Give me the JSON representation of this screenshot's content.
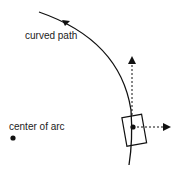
{
  "diagram": {
    "labels": {
      "curved_path": "curved path",
      "center_of_arc": "center of arc"
    },
    "colors": {
      "stroke": "#111111",
      "background": "#ffffff"
    }
  }
}
